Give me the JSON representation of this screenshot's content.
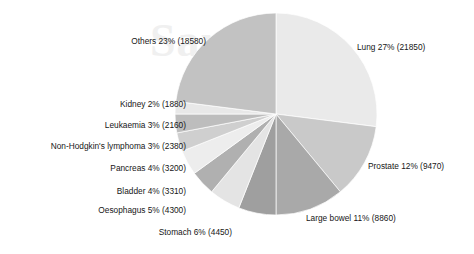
{
  "watermark": {
    "text": "Sample"
  },
  "chart_data": {
    "type": "pie",
    "title": "",
    "subtitle": "",
    "xlabel": "",
    "ylabel": "",
    "grid": false,
    "legend_position": "none",
    "label_format": "{name} {percent}% ({value})",
    "total": 81440,
    "start_angle_deg": 0,
    "direction": "clockwise",
    "categories": [
      "Lung",
      "Prostate",
      "Large bowel",
      "Stomach",
      "Oesophagus",
      "Bladder",
      "Pancreas",
      "Non-Hodgkin's lymphoma",
      "Leukaemia",
      "Kidney",
      "Others"
    ],
    "values": [
      21850,
      9470,
      8860,
      4450,
      4300,
      3310,
      3200,
      2380,
      2160,
      1880,
      18580
    ],
    "percents": [
      27,
      12,
      11,
      6,
      5,
      4,
      4,
      3,
      3,
      2,
      23
    ],
    "colors": [
      "#eaeaea",
      "#c9c9c9",
      "#a9a9a9",
      "#9f9f9f",
      "#e4e4e4",
      "#b0b0b0",
      "#ededed",
      "#cfcfcf",
      "#bdbdbd",
      "#e8e8e8",
      "#c2c2c2"
    ],
    "slices": [
      {
        "name": "Lung",
        "percent": 27,
        "value": 21850,
        "color": "#eaeaea",
        "label": "Lung 27% (21850)"
      },
      {
        "name": "Prostate",
        "percent": 12,
        "value": 9470,
        "color": "#c9c9c9",
        "label": "Prostate 12% (9470)"
      },
      {
        "name": "Large bowel",
        "percent": 11,
        "value": 8860,
        "color": "#a9a9a9",
        "label": "Large bowel 11% (8860)"
      },
      {
        "name": "Stomach",
        "percent": 6,
        "value": 4450,
        "color": "#9f9f9f",
        "label": "Stomach 6% (4450)"
      },
      {
        "name": "Oesophagus",
        "percent": 5,
        "value": 4300,
        "color": "#e4e4e4",
        "label": "Oesophagus 5% (4300)"
      },
      {
        "name": "Bladder",
        "percent": 4,
        "value": 3310,
        "color": "#b0b0b0",
        "label": "Bladder 4% (3310)"
      },
      {
        "name": "Pancreas",
        "percent": 4,
        "value": 3200,
        "color": "#ededed",
        "label": "Pancreas 4% (3200)"
      },
      {
        "name": "Non-Hodgkin's lymphoma",
        "percent": 3,
        "value": 2380,
        "color": "#cfcfcf",
        "label": "Non-Hodgkin's lymphoma 3% (2380)"
      },
      {
        "name": "Leukaemia",
        "percent": 3,
        "value": 2160,
        "color": "#bdbdbd",
        "label": "Leukaemia 3% (2160)"
      },
      {
        "name": "Kidney",
        "percent": 2,
        "value": 1880,
        "color": "#e8e8e8",
        "label": "Kidney 2% (1880)"
      },
      {
        "name": "Others",
        "percent": 23,
        "value": 18580,
        "color": "#c2c2c2",
        "label": "Others 23% (18580)"
      }
    ]
  },
  "labels": {
    "lung": "Lung 27% (21850)",
    "prostate": "Prostate 12% (9470)",
    "large_bowel": "Large bowel 11% (8860)",
    "stomach": "Stomach 6% (4450)",
    "oesophagus": "Oesophagus 5% (4300)",
    "bladder": "Bladder 4% (3310)",
    "pancreas": "Pancreas 4% (3200)",
    "non_hodgkin": "Non-Hodgkin's lymphoma 3% (2380)",
    "leukaemia": "Leukaemia 3% (2160)",
    "kidney": "Kidney 2% (1880)",
    "others": "Others 23% (18580)"
  }
}
